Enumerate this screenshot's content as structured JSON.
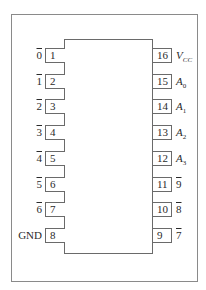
{
  "diagram": {
    "type": "ic-pinout",
    "package": "DIP-16",
    "left_pins": [
      {
        "number": "1",
        "signal": "0",
        "active_low": true
      },
      {
        "number": "2",
        "signal": "1",
        "active_low": true
      },
      {
        "number": "3",
        "signal": "2",
        "active_low": true
      },
      {
        "number": "4",
        "signal": "3",
        "active_low": true
      },
      {
        "number": "5",
        "signal": "4",
        "active_low": true
      },
      {
        "number": "6",
        "signal": "5",
        "active_low": true
      },
      {
        "number": "7",
        "signal": "6",
        "active_low": true
      },
      {
        "number": "8",
        "signal": "GND",
        "active_low": false
      }
    ],
    "right_pins": [
      {
        "number": "16",
        "signal": "V",
        "subscript": "CC",
        "italic": true
      },
      {
        "number": "15",
        "signal": "A",
        "subscript": "0",
        "italic": true
      },
      {
        "number": "14",
        "signal": "A",
        "subscript": "1",
        "italic": true
      },
      {
        "number": "13",
        "signal": "A",
        "subscript": "2",
        "italic": true
      },
      {
        "number": "12",
        "signal": "A",
        "subscript": "3",
        "italic": true
      },
      {
        "number": "11",
        "signal": "9",
        "active_low": true
      },
      {
        "number": "10",
        "signal": "8",
        "active_low": true
      },
      {
        "number": "9",
        "signal": "7",
        "active_low": true
      }
    ]
  }
}
